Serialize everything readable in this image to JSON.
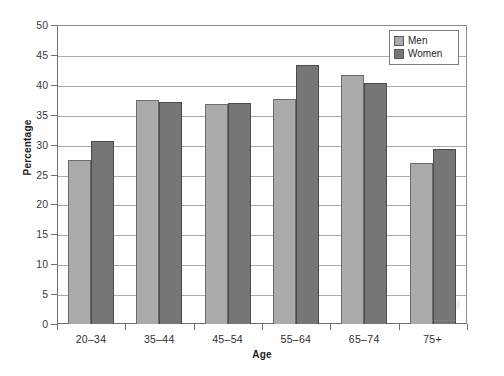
{
  "chart_data": {
    "type": "bar",
    "title": "",
    "xlabel": "Age",
    "ylabel": "Percentage",
    "categories": [
      "20–34",
      "35–44",
      "45–54",
      "55–64",
      "65–74",
      "75+"
    ],
    "series": [
      {
        "name": "Men",
        "color": "#ababab",
        "values": [
          27.5,
          37.4,
          36.8,
          37.6,
          41.6,
          27.0
        ]
      },
      {
        "name": "Women",
        "color": "#767676",
        "values": [
          30.6,
          37.2,
          37.0,
          43.3,
          40.3,
          29.2
        ]
      }
    ],
    "ylim": [
      0,
      50
    ],
    "yticks": [
      0,
      5,
      10,
      15,
      20,
      25,
      30,
      35,
      40,
      45,
      50
    ],
    "ytick_labels": [
      "0",
      "5",
      "10",
      "15",
      "20",
      "25",
      "30",
      "35",
      "40",
      "45",
      "50"
    ],
    "grid": true,
    "grid_axis": "y",
    "legend_position": "top-right",
    "legend_entries": [
      "Men",
      "Women"
    ]
  },
  "legend": {
    "men_label": "Men",
    "women_label": "Women"
  },
  "axes": {
    "x_title": "Age",
    "y_title": "Percentage"
  }
}
